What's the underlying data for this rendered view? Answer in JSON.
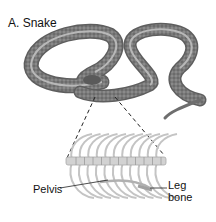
{
  "figure": {
    "title": "A. Snake",
    "labels": {
      "pelvis": "Pelvis",
      "leg_bone_line1": "Leg",
      "leg_bone_line2": "bone"
    }
  },
  "colors": {
    "snake_body": "#7a7a7a",
    "snake_stripe": "#b5b5b5",
    "skeleton": "#c9c9c9",
    "leader_line": "#222222"
  }
}
